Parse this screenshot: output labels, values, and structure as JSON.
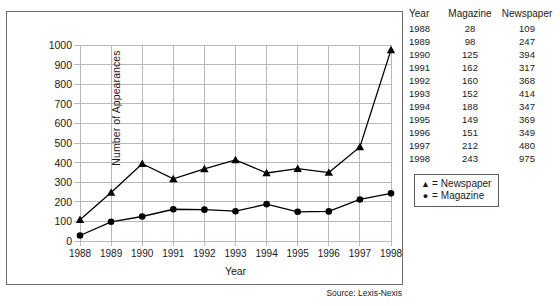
{
  "chart_data": {
    "type": "line",
    "title": "",
    "xlabel": "Year",
    "ylabel": "Number of Appearances",
    "categories": [
      "1988",
      "1989",
      "1990",
      "1991",
      "1992",
      "1993",
      "1994",
      "1995",
      "1996",
      "1997",
      "1998"
    ],
    "x": [
      1988,
      1989,
      1990,
      1991,
      1992,
      1993,
      1994,
      1995,
      1996,
      1997,
      1998
    ],
    "series": [
      {
        "name": "Newspaper",
        "marker": "triangle",
        "values": [
          109,
          247,
          394,
          317,
          368,
          414,
          347,
          369,
          349,
          480,
          975
        ]
      },
      {
        "name": "Magazine",
        "marker": "circle",
        "values": [
          28,
          98,
          125,
          162,
          160,
          152,
          188,
          149,
          151,
          212,
          243
        ]
      }
    ],
    "ylim": [
      0,
      1000
    ],
    "ytick_labels": [
      "1000",
      "900",
      "800",
      "700",
      "600",
      "500",
      "400",
      "300",
      "200",
      "100",
      "0"
    ],
    "yticks": [
      1000,
      900,
      800,
      700,
      600,
      500,
      400,
      300,
      200,
      100,
      0
    ],
    "xlim": [
      1988,
      1998
    ],
    "grid": true,
    "legend_position": "right-outside",
    "annotations": [
      "Source: Lexis-Nexis"
    ]
  },
  "axes": {
    "y_title": "Number of Appearances",
    "x_title": "Year"
  },
  "legend": {
    "rows": [
      {
        "mark": "▲",
        "eq": "=",
        "label": "Newspaper"
      },
      {
        "mark": "●",
        "eq": "=",
        "label": "Magazine"
      }
    ]
  },
  "table": {
    "headers": {
      "year": "Year",
      "magazine": "Magazine",
      "newspaper": "Newspaper"
    },
    "rows": [
      {
        "year": "1988",
        "magazine": "28",
        "newspaper": "109"
      },
      {
        "year": "1989",
        "magazine": "98",
        "newspaper": "247"
      },
      {
        "year": "1990",
        "magazine": "125",
        "newspaper": "394"
      },
      {
        "year": "1991",
        "magazine": "162",
        "newspaper": "317"
      },
      {
        "year": "1992",
        "magazine": "160",
        "newspaper": "368"
      },
      {
        "year": "1993",
        "magazine": "152",
        "newspaper": "414"
      },
      {
        "year": "1994",
        "magazine": "188",
        "newspaper": "347"
      },
      {
        "year": "1995",
        "magazine": "149",
        "newspaper": "369"
      },
      {
        "year": "1996",
        "magazine": "151",
        "newspaper": "349"
      },
      {
        "year": "1997",
        "magazine": "212",
        "newspaper": "480"
      },
      {
        "year": "1998",
        "magazine": "243",
        "newspaper": "975"
      }
    ]
  },
  "source": {
    "note": "Source: Lexis-Nexis"
  },
  "colors": {
    "series_line": "#000000",
    "grid": "#b9b9b9",
    "frame": "#6e6e6e",
    "background": "#ffffff"
  }
}
